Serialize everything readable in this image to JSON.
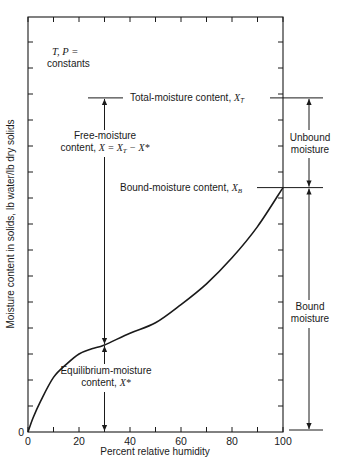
{
  "figure": {
    "params_label_line1": "T, P =",
    "params_label_line2": "constants",
    "total_moisture_label": "Total-moisture content,",
    "total_moisture_symbol": "X",
    "total_moisture_sub": "T",
    "free_moisture_line1": "Free-moisture",
    "free_moisture_line2": "content,",
    "free_moisture_formula": "X = X",
    "free_moisture_formula_sub": "T",
    "free_moisture_formula_tail": " − X*",
    "bound_content_label": "Bound-moisture content,",
    "bound_content_symbol": "X",
    "bound_content_sub": "B",
    "equilibrium_line1": "Equilibrium-moisture",
    "equilibrium_line2": "content,",
    "equilibrium_symbol": "X*",
    "unbound_line1": "Unbound",
    "unbound_line2": "moisture",
    "bound_line1": "Bound",
    "bound_line2": "moisture"
  },
  "chart_data": {
    "type": "line",
    "title": "",
    "xlabel": "Percent relative humidity",
    "ylabel": "Moisture content in solids, lb water/lb dry solids",
    "x_ticks": [
      0,
      20,
      40,
      60,
      80,
      100
    ],
    "x_minor_step": 10,
    "y_tick_labels": [
      "0"
    ],
    "xlim": [
      0,
      100
    ],
    "ylim": [
      0,
      16
    ],
    "y_units_note": "relative tick units (no numeric y labels shown except 0)",
    "grid": false,
    "series": [
      {
        "name": "Equilibrium moisture isotherm",
        "x": [
          0,
          2,
          5,
          10,
          15,
          20,
          25,
          30,
          40,
          50,
          60,
          70,
          80,
          90,
          100
        ],
        "values": [
          0,
          0.55,
          1.2,
          2.1,
          2.6,
          3.0,
          3.2,
          3.35,
          3.8,
          4.2,
          4.9,
          5.7,
          6.7,
          7.9,
          9.4
        ]
      }
    ],
    "annotations": {
      "X_T": 12.85,
      "X_B": 9.4,
      "X_star_at_rh": 30,
      "X_star": 3.35
    }
  },
  "colors": {
    "ink": "#1a1a1a",
    "background": "#ffffff"
  }
}
